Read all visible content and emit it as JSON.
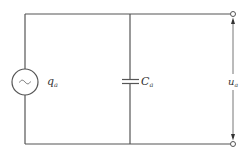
{
  "diagram": {
    "type": "circuit",
    "components": [
      {
        "id": "source",
        "kind": "ac-charge-source",
        "symbol": "~",
        "label": "q",
        "subscript": "a"
      },
      {
        "id": "capacitor",
        "kind": "capacitor",
        "label": "C",
        "subscript": "a"
      },
      {
        "id": "output",
        "kind": "output-voltage",
        "label": "u",
        "subscript": "a"
      }
    ],
    "colors": {
      "wire": "#555555",
      "text": "#333333",
      "background": "#ffffff"
    }
  }
}
